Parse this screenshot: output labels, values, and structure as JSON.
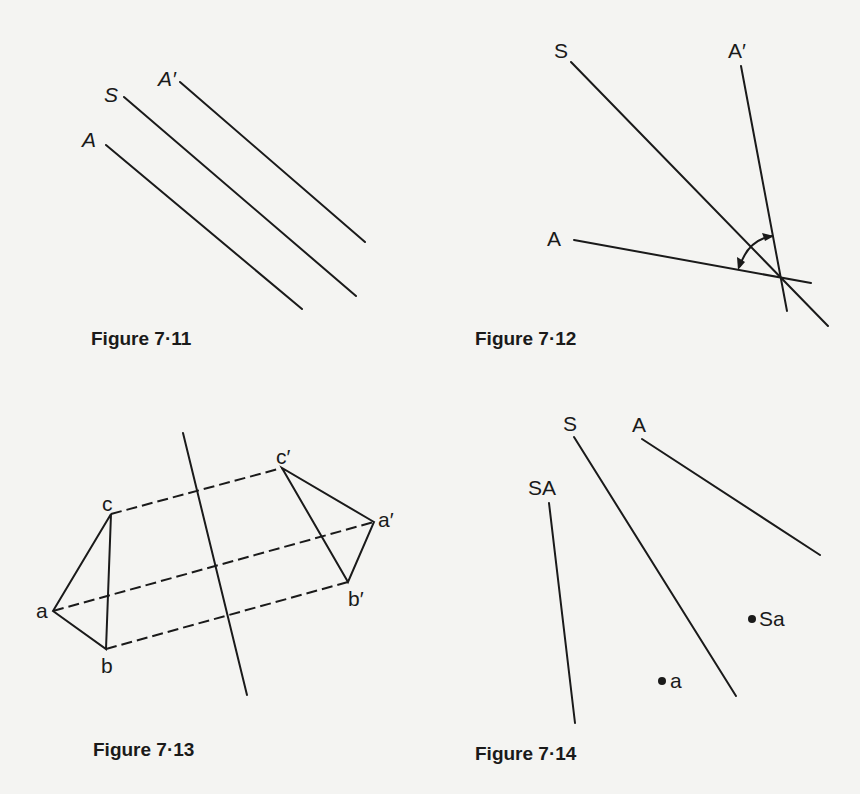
{
  "figures": [
    {
      "id": "fig-7-11",
      "caption": "Figure 7·11",
      "labels": {
        "A": "A",
        "S": "S",
        "A_prime": "A′"
      }
    },
    {
      "id": "fig-7-12",
      "caption": "Figure 7·12",
      "labels": {
        "S": "S",
        "A_prime": "A′",
        "A": "A"
      }
    },
    {
      "id": "fig-7-13",
      "caption": "Figure 7·13",
      "labels": {
        "a": "a",
        "b": "b",
        "c": "c",
        "a_prime": "a′",
        "b_prime": "b′",
        "c_prime": "c′"
      }
    },
    {
      "id": "fig-7-14",
      "caption": "Figure 7·14",
      "labels": {
        "S": "S",
        "A": "A",
        "SA": "SA",
        "Sa": "Sa",
        "a": "a"
      }
    }
  ],
  "colors": {
    "ink": "#1a1a1a",
    "paper": "#f4f4f2"
  }
}
